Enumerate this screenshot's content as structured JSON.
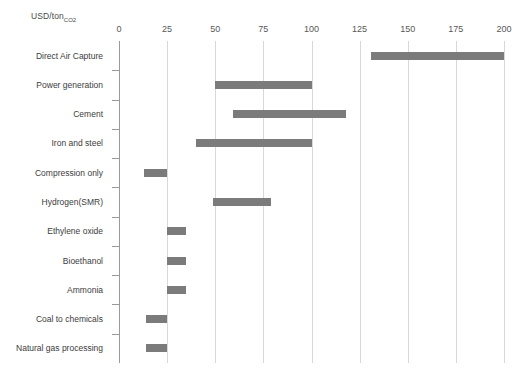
{
  "chart_data": {
    "type": "bar",
    "orientation": "horizontal",
    "subtype": "range-bar",
    "title": "USD/ton",
    "title_subscript": "CO2",
    "xlabel": "USD/tonCO2",
    "ylabel": "",
    "xlim": [
      0,
      210
    ],
    "xticks": [
      0,
      25,
      50,
      75,
      100,
      125,
      150,
      175,
      200
    ],
    "xtick_labels": [
      "0",
      "25",
      "50",
      "75",
      "100",
      "125",
      "150",
      "175",
      "200"
    ],
    "grid": true,
    "legend": false,
    "bar_color": "#7b7b7b",
    "grid_color": "#d8d8d8",
    "axis_color": "#9a9a9a",
    "categories": [
      "Direct Air Capture",
      "Power generation",
      "Cement",
      "Iron and steel",
      "Compression only",
      "Hydrogen(SMR)",
      "Ethylene oxide",
      "Bioethanol",
      "Ammonia",
      "Coal to chemicals",
      "Natural gas processing"
    ],
    "ranges": [
      {
        "category": "Direct Air Capture",
        "low": 131,
        "high": 200
      },
      {
        "category": "Power generation",
        "low": 50,
        "high": 100
      },
      {
        "category": "Cement",
        "low": 59,
        "high": 118
      },
      {
        "category": "Iron and steel",
        "low": 40,
        "high": 100
      },
      {
        "category": "Compression only",
        "low": 13,
        "high": 25
      },
      {
        "category": "Hydrogen(SMR)",
        "low": 49,
        "high": 79
      },
      {
        "category": "Ethylene oxide",
        "low": 25,
        "high": 35
      },
      {
        "category": "Bioethanol",
        "low": 25,
        "high": 35
      },
      {
        "category": "Ammonia",
        "low": 25,
        "high": 35
      },
      {
        "category": "Coal to chemicals",
        "low": 14,
        "high": 25
      },
      {
        "category": "Natural gas processing",
        "low": 14,
        "high": 25
      }
    ]
  }
}
